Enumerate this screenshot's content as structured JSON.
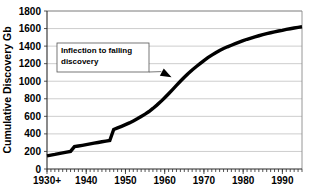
{
  "chart_data": {
    "type": "line",
    "title": "",
    "subtitle": "",
    "xlabel": "",
    "ylabel": "Cumulative Discovery Gb",
    "xlim": [
      1930,
      1995
    ],
    "ylim": [
      0,
      1800
    ],
    "grid": true,
    "legend": false,
    "legend_position": "none",
    "y_ticks": [
      0,
      200,
      400,
      600,
      800,
      1000,
      1200,
      1400,
      1600,
      1800
    ],
    "y_tick_labels": [
      "0",
      "200",
      "400",
      "600",
      "800",
      "1000",
      "1200",
      "1400",
      "1600",
      "1800"
    ],
    "x_ticks": [
      1930,
      1940,
      1950,
      1960,
      1970,
      1980,
      1990
    ],
    "x_tick_labels": [
      "1930+",
      "1940",
      "1950",
      "1960",
      "1970",
      "1980",
      "1990"
    ],
    "x_minor_tick_interval": 1,
    "series": [
      {
        "name": "Cumulative Discovery",
        "x": [
          1930,
          1931,
          1932,
          1933,
          1934,
          1935,
          1936,
          1937,
          1938,
          1939,
          1940,
          1941,
          1942,
          1943,
          1944,
          1945,
          1946,
          1947,
          1948,
          1949,
          1950,
          1951,
          1952,
          1953,
          1954,
          1955,
          1956,
          1957,
          1958,
          1959,
          1960,
          1961,
          1962,
          1963,
          1964,
          1965,
          1966,
          1967,
          1968,
          1969,
          1970,
          1971,
          1972,
          1973,
          1974,
          1975,
          1976,
          1977,
          1978,
          1979,
          1980,
          1981,
          1982,
          1983,
          1984,
          1985,
          1986,
          1987,
          1988,
          1989,
          1990,
          1991,
          1992,
          1993,
          1994,
          1995
        ],
        "values": [
          150,
          158,
          166,
          175,
          183,
          192,
          200,
          255,
          262,
          270,
          278,
          286,
          294,
          302,
          310,
          318,
          325,
          450,
          468,
          486,
          505,
          525,
          548,
          572,
          598,
          625,
          655,
          690,
          728,
          768,
          812,
          858,
          905,
          952,
          1000,
          1045,
          1088,
          1128,
          1165,
          1200,
          1235,
          1268,
          1298,
          1325,
          1350,
          1372,
          1392,
          1410,
          1428,
          1446,
          1462,
          1478,
          1492,
          1505,
          1518,
          1530,
          1542,
          1552,
          1562,
          1572,
          1580,
          1590,
          1598,
          1606,
          1614,
          1620
        ]
      }
    ],
    "annotations": [
      {
        "text_line1": "Inflection to falling",
        "text_line2": "discovery",
        "points_to_x": 1962,
        "points_to_y": 1000
      }
    ]
  },
  "axis": {
    "y_label": "Cumulative Discovery Gb"
  }
}
